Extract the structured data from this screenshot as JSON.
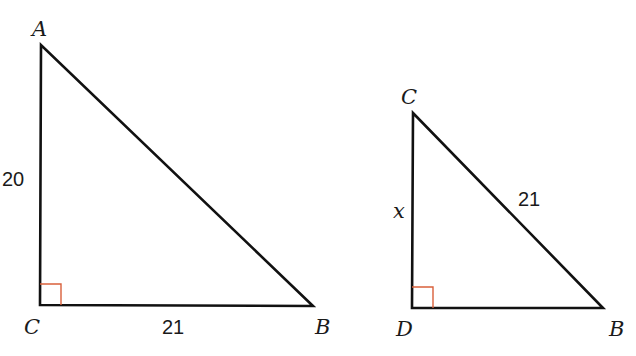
{
  "figure": {
    "triangles": [
      {
        "name": "triangle-ACB",
        "vertices": [
          {
            "label": "A",
            "x": 41,
            "y": 45,
            "label_x": 32,
            "label_y": 36
          },
          {
            "label": "C",
            "x": 40,
            "y": 305,
            "label_x": 24,
            "label_y": 334
          },
          {
            "label": "B",
            "x": 313,
            "y": 306,
            "label_x": 315,
            "label_y": 334
          }
        ],
        "right_angle_at": "C",
        "side_labels": [
          {
            "side": "AC",
            "text": "20",
            "x": 2,
            "y": 186
          },
          {
            "side": "CB",
            "text": "21",
            "x": 162,
            "y": 334
          }
        ]
      },
      {
        "name": "triangle-CDB",
        "vertices": [
          {
            "label": "C",
            "x": 413,
            "y": 113,
            "label_x": 401,
            "label_y": 104
          },
          {
            "label": "D",
            "x": 412,
            "y": 308,
            "label_x": 396,
            "label_y": 336
          },
          {
            "label": "B",
            "x": 603,
            "y": 308,
            "label_x": 609,
            "label_y": 336
          }
        ],
        "right_angle_at": "D",
        "side_labels": [
          {
            "side": "CD",
            "text": "x",
            "x": 393,
            "y": 218,
            "italic": true
          },
          {
            "side": "CB",
            "text": "21",
            "x": 518,
            "y": 206
          }
        ]
      }
    ],
    "colors": {
      "line": "#111111",
      "right_angle_marker": "#d9603b",
      "text": "#1a1a1a",
      "background": "#ffffff"
    }
  }
}
